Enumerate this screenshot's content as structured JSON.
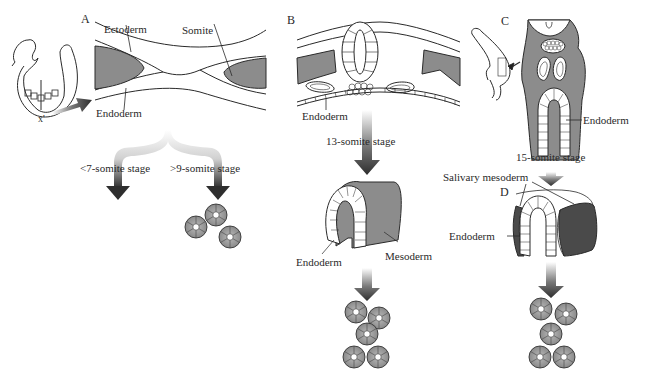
{
  "panels": {
    "A": {
      "letter": "A",
      "labels": {
        "ectoderm": "Ectoderm",
        "somite": "Somite",
        "endoderm": "Endoderm",
        "section_top": "x'",
        "section_bottom": "x'"
      },
      "branches": [
        {
          "stage": "<7-somite stage",
          "outcome": "no-glands"
        },
        {
          "stage": ">9-somite stage",
          "outcome": "glands",
          "gland_count": 3
        }
      ]
    },
    "B": {
      "letter": "B",
      "labels": {
        "endoderm": "Endoderm"
      },
      "stage": "13-somite stage",
      "explant_labels": {
        "endoderm": "Endoderm",
        "mesoderm": "Mesoderm"
      },
      "gland_count": 5
    },
    "C": {
      "letter": "C",
      "labels": {
        "endoderm": "Endoderm"
      },
      "stage": "15-somite stage"
    },
    "D": {
      "letter": "D",
      "labels": {
        "salivary_mesoderm": "Salivary mesoderm",
        "endoderm": "Endoderm"
      },
      "gland_count": 5
    }
  },
  "colors": {
    "tissue_gray": "#8c8c8c",
    "dark_mesoderm": "#4a4a4a",
    "arrow_dark": "#3a3a3a",
    "line": "#2a2a2a"
  }
}
